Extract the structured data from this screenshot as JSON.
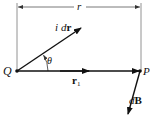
{
  "diagram": {
    "labels": {
      "distance": "r",
      "current_element_i": "i",
      "current_element_d": "d",
      "current_element_vec": "r",
      "angle": "θ",
      "source_point": "Q",
      "field_point": "P",
      "unit_vector": "r",
      "unit_vector_sub": "1",
      "field_d": "d",
      "field_vec": "B"
    },
    "colors": {
      "stroke": "#111111",
      "thin_line": "#555555",
      "background": "#ffffff"
    }
  }
}
